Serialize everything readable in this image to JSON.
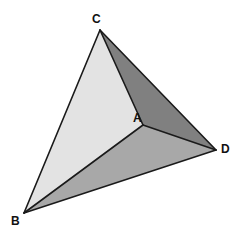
{
  "figure": {
    "type": "tetrahedron-net-diagram",
    "background_color": "#ffffff",
    "canvas": {
      "width": 244,
      "height": 240
    },
    "edge_color": "#1a1a1a",
    "edge_width": 1.6,
    "vertices": [
      {
        "id": "A",
        "label": "A",
        "x": 143,
        "y": 125,
        "label_x": 133,
        "label_y": 112
      },
      {
        "id": "B",
        "label": "B",
        "x": 24,
        "y": 213,
        "label_x": 11,
        "label_y": 215
      },
      {
        "id": "C",
        "label": "C",
        "x": 100,
        "y": 30,
        "label_x": 92,
        "label_y": 13
      },
      {
        "id": "D",
        "label": "D",
        "x": 216,
        "y": 150,
        "label_x": 221,
        "label_y": 143
      }
    ],
    "faces": [
      {
        "id": "face-BCA",
        "name": "face-left-light",
        "vertices": "B,C,A",
        "points": "24,213 100,30 143,125",
        "fill": "#e3e3e3"
      },
      {
        "id": "face-CAD",
        "name": "face-upper-right-dark",
        "vertices": "C,A,D",
        "points": "100,30 143,125 216,150",
        "fill": "#808080"
      },
      {
        "id": "face-BAD",
        "name": "face-bottom-medium",
        "vertices": "B,A,D",
        "points": "24,213 143,125 216,150",
        "fill": "#a8a8a8"
      }
    ],
    "edges": [
      {
        "id": "edge-BC",
        "from": "B",
        "to": "C",
        "x1": 24,
        "y1": 213,
        "x2": 100,
        "y2": 30
      },
      {
        "id": "edge-CD",
        "from": "C",
        "to": "D",
        "x1": 100,
        "y1": 30,
        "x2": 216,
        "y2": 150
      },
      {
        "id": "edge-BD",
        "from": "B",
        "to": "D",
        "x1": 24,
        "y1": 213,
        "x2": 216,
        "y2": 150
      },
      {
        "id": "edge-AB",
        "from": "A",
        "to": "B",
        "x1": 143,
        "y1": 125,
        "x2": 24,
        "y2": 213
      },
      {
        "id": "edge-AC",
        "from": "A",
        "to": "C",
        "x1": 143,
        "y1": 125,
        "x2": 100,
        "y2": 30
      },
      {
        "id": "edge-AD",
        "from": "A",
        "to": "D",
        "x1": 143,
        "y1": 125,
        "x2": 216,
        "y2": 150
      }
    ],
    "labels": {
      "A": "A",
      "B": "B",
      "C": "C",
      "D": "D"
    }
  }
}
